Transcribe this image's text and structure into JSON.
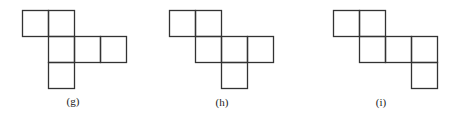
{
  "square_size": 26,
  "stroke_color": "#333333",
  "figures": [
    {
      "label": "(g)",
      "origin": [
        22,
        10
      ],
      "label_pos": [
        73,
        95
      ],
      "cells": [
        [
          0,
          0
        ],
        [
          1,
          0
        ],
        [
          1,
          1
        ],
        [
          2,
          1
        ],
        [
          3,
          1
        ],
        [
          1,
          2
        ]
      ]
    },
    {
      "label": "(h)",
      "origin": [
        169,
        10
      ],
      "label_pos": [
        222,
        96
      ],
      "cells": [
        [
          0,
          0
        ],
        [
          1,
          0
        ],
        [
          1,
          1
        ],
        [
          2,
          1
        ],
        [
          3,
          1
        ],
        [
          2,
          2
        ]
      ]
    },
    {
      "label": "(i)",
      "origin": [
        333,
        10
      ],
      "label_pos": [
        381,
        96
      ],
      "cells": [
        [
          0,
          0
        ],
        [
          1,
          0
        ],
        [
          1,
          1
        ],
        [
          2,
          1
        ],
        [
          3,
          1
        ],
        [
          3,
          2
        ]
      ]
    }
  ]
}
